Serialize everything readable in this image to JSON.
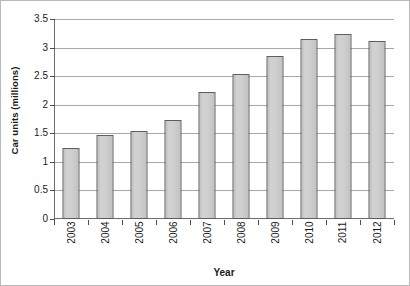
{
  "chart_data": {
    "type": "bar",
    "title": "",
    "xlabel": "Year",
    "ylabel": "Car units (millions)",
    "categories": [
      "2003",
      "2004",
      "2005",
      "2006",
      "2007",
      "2008",
      "2009",
      "2010",
      "2011",
      "2012"
    ],
    "values": [
      1.24,
      1.47,
      1.54,
      1.73,
      2.22,
      2.54,
      2.85,
      3.15,
      3.23,
      3.11
    ],
    "ylim": [
      0,
      3.5
    ],
    "yticks": [
      0,
      0.5,
      1,
      1.5,
      2,
      2.5,
      3,
      3.5
    ],
    "ytick_labels": [
      "0",
      "0.5",
      "1",
      "1.5",
      "2",
      "2.5",
      "3",
      "3.5"
    ],
    "grid": "horizontal",
    "legend": "none",
    "series": [
      {
        "name": "Car units",
        "values": [
          1.24,
          1.47,
          1.54,
          1.73,
          2.22,
          2.54,
          2.85,
          3.15,
          3.23,
          3.11
        ]
      }
    ],
    "colors": {
      "bar_fill": "#cfcfcf",
      "bar_border": "#5e5e5e",
      "gridline": "#a8a8a8",
      "axis": "#6d6d6d",
      "text": "#1a1a1a",
      "background": "#ffffff",
      "frame": "#b9b9b9"
    }
  }
}
